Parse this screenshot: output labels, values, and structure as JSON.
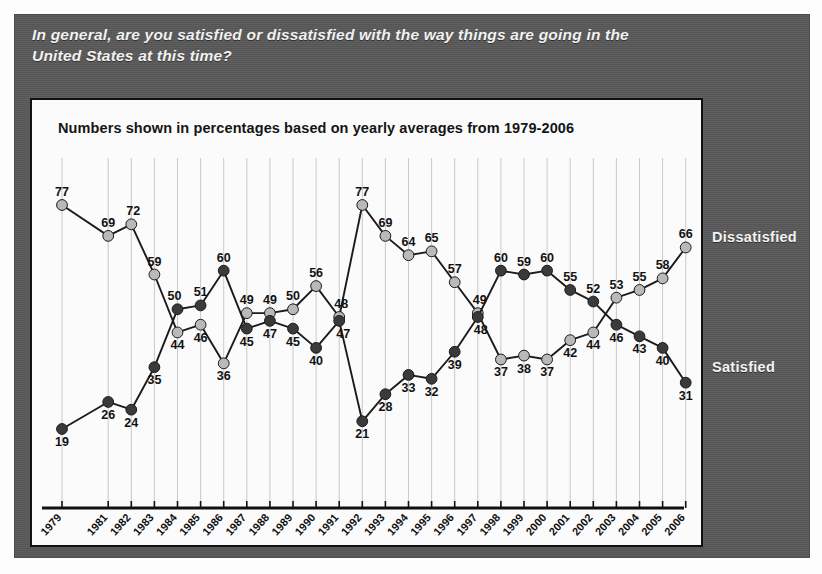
{
  "question": "In general, are you satisfied or dissatisfied with the way things are going in the United States at this time?",
  "subtitle": "Numbers shown in percentages based on yearly averages from 1979-2006",
  "legend": {
    "dissatisfied": "Dissatisfied",
    "satisfied": "Satisfied"
  },
  "colors": {
    "panel": "#585858",
    "chart_background": "#fbfbfb",
    "frame": "#111111",
    "dissatisfied": "#b9b9b9",
    "satisfied": "#3a3a3a",
    "gridline": "#c9c9c9",
    "axis": "#111111",
    "label_text": "#111111",
    "legend_text": "#f4f4f4"
  },
  "chart_data": {
    "type": "line",
    "title": "In general, are you satisfied or dissatisfied with the way things are going in the United States at this time?",
    "subtitle": "Numbers shown in percentages based on yearly averages from 1979-2006",
    "xlabel": "",
    "ylabel": "",
    "ylim": [
      0,
      85
    ],
    "grid": "vertical",
    "legend_position": "right",
    "categories": [
      "1979",
      "1981",
      "1982",
      "1983",
      "1984",
      "1985",
      "1986",
      "1987",
      "1988",
      "1989",
      "1990",
      "1991",
      "1992",
      "1993",
      "1994",
      "1995",
      "1996",
      "1997",
      "1998",
      "1999",
      "2000",
      "2001",
      "2002",
      "2003",
      "2004",
      "2005",
      "2006"
    ],
    "series": [
      {
        "name": "Dissatisfied",
        "color": "#b9b9b9",
        "values": [
          77,
          69,
          72,
          59,
          44,
          46,
          36,
          49,
          49,
          50,
          56,
          48,
          77,
          69,
          64,
          65,
          57,
          49,
          37,
          38,
          37,
          42,
          44,
          53,
          55,
          58,
          66
        ]
      },
      {
        "name": "Satisfied",
        "color": "#3a3a3a",
        "values": [
          19,
          26,
          24,
          35,
          50,
          51,
          60,
          45,
          47,
          45,
          40,
          47,
          21,
          28,
          33,
          32,
          39,
          48,
          60,
          59,
          60,
          55,
          52,
          46,
          43,
          40,
          31
        ]
      }
    ]
  }
}
